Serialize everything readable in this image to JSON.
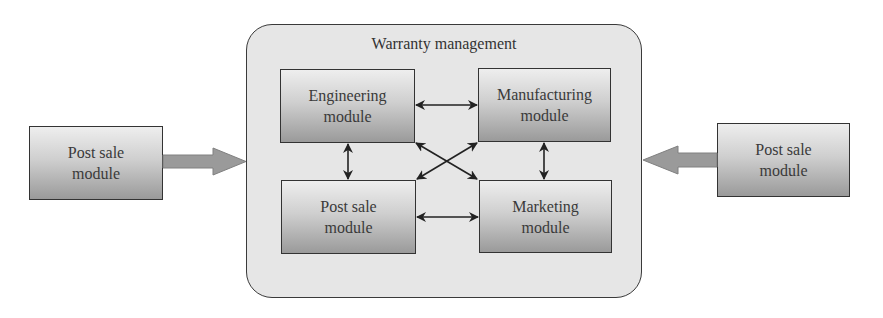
{
  "diagram": {
    "container": {
      "title": "Warranty management"
    },
    "modules": {
      "engineering": {
        "line1": "Engineering",
        "line2": "module"
      },
      "manufacturing": {
        "line1": "Manufacturing",
        "line2": "module"
      },
      "post_sale_inner": {
        "line1": "Post sale",
        "line2": "module"
      },
      "marketing": {
        "line1": "Marketing",
        "line2": "module"
      }
    },
    "external": {
      "left": {
        "line1": "Post sale",
        "line2": "module"
      },
      "right": {
        "line1": "Post sale",
        "line2": "module"
      }
    },
    "connections": [
      {
        "from": "Engineering module",
        "to": "Manufacturing module",
        "type": "bidirectional"
      },
      {
        "from": "Engineering module",
        "to": "Post sale module",
        "type": "bidirectional"
      },
      {
        "from": "Engineering module",
        "to": "Marketing module",
        "type": "bidirectional"
      },
      {
        "from": "Manufacturing module",
        "to": "Post sale module",
        "type": "bidirectional"
      },
      {
        "from": "Manufacturing module",
        "to": "Marketing module",
        "type": "bidirectional"
      },
      {
        "from": "Post sale module",
        "to": "Marketing module",
        "type": "bidirectional"
      },
      {
        "from": "Post sale module (left, external)",
        "to": "Warranty management",
        "type": "block-arrow"
      },
      {
        "from": "Post sale module (right, external)",
        "to": "Warranty management",
        "type": "block-arrow"
      }
    ],
    "colors": {
      "container_fill": "#e6e6e6",
      "border": "#333333",
      "module_gradient_top": "#eeeeee",
      "module_gradient_bottom": "#9a9a9a",
      "block_arrow": "#9a9a9a",
      "text": "#333333"
    }
  }
}
